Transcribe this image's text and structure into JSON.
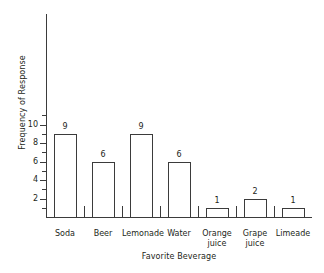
{
  "chart_data": {
    "type": "bar",
    "title": "",
    "xlabel": "Favorite Beverage",
    "ylabel": "Frequency of Response",
    "categories": [
      "Soda",
      "Beer",
      "Lemonade",
      "Water",
      "Orange juice",
      "Grape juice",
      "Limeade"
    ],
    "values": [
      9,
      6,
      9,
      6,
      1,
      2,
      1
    ],
    "bar_labels": [
      "9",
      "6",
      "9",
      "6",
      "1",
      "2",
      "1"
    ],
    "ylim": [
      0,
      11
    ],
    "y_major_ticks": [
      2,
      4,
      6,
      8,
      10
    ],
    "y_major_tick_labels": [
      "2",
      "4",
      "6",
      "8",
      "10"
    ],
    "y_minor_ticks": [
      1,
      3,
      5,
      7,
      9,
      11
    ],
    "grid": false,
    "legend": false,
    "bar_fill_color": "#ffffff",
    "bar_edge_color": "#3b3b3b",
    "axis_color": "#3b3b3b",
    "text_color": "#231f20",
    "background_color": "#ffffff"
  },
  "category_label_lines": [
    [
      "Soda"
    ],
    [
      "Beer"
    ],
    [
      "Lemonade"
    ],
    [
      "Water"
    ],
    [
      "Orange",
      "juice"
    ],
    [
      "Grape",
      "juice"
    ],
    [
      "Limeade"
    ]
  ]
}
